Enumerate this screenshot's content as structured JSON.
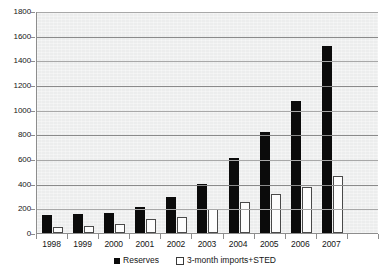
{
  "chart_data": {
    "type": "bar",
    "title": "",
    "xlabel": "",
    "ylabel": "",
    "ylim": [
      0,
      1800
    ],
    "ytick_step": 200,
    "yticks": [
      "0",
      "200",
      "400",
      "600",
      "800",
      "1000",
      "1200",
      "1400",
      "1600",
      "1800"
    ],
    "grid": true,
    "legend_position": "bottom",
    "categories": [
      "1998",
      "1999",
      "2000",
      "2001",
      "2002",
      "2003",
      "2004",
      "2005",
      "2006",
      "2007"
    ],
    "series": [
      {
        "name": "Reserves",
        "color": "#0b0b0b",
        "values": [
          145,
          155,
          165,
          210,
          290,
          400,
          610,
          820,
          1070,
          1520
        ]
      },
      {
        "name": "3-month imports+STED",
        "color": "#ffffff",
        "values": [
          50,
          60,
          70,
          115,
          130,
          195,
          250,
          320,
          375,
          460
        ]
      }
    ]
  },
  "legend": {
    "items": [
      {
        "label": "Reserves",
        "marker": "filled-square-icon"
      },
      {
        "label": "3-month imports+STED",
        "marker": "open-square-icon"
      }
    ]
  },
  "colors": {
    "plot_background": "#eceded",
    "gridline": "#a8a8a8",
    "axis": "#8d8d8d",
    "text": "#151515"
  }
}
